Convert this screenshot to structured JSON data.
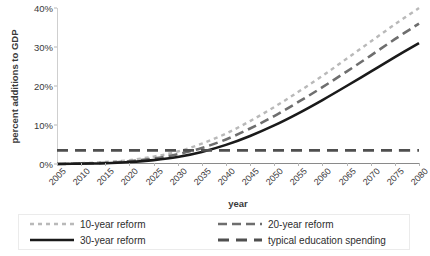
{
  "chart_data": {
    "type": "line",
    "title": "",
    "xlabel": "year",
    "ylabel": "percent additions to GDP",
    "xlim": [
      2005,
      2080
    ],
    "ylim": [
      0,
      40
    ],
    "grid": false,
    "legend_position": "bottom",
    "x_tick_labels": [
      "2005",
      "2010",
      "2015",
      "2020",
      "2025",
      "2030",
      "2035",
      "2040",
      "2045",
      "2050",
      "2055",
      "2060",
      "2065",
      "2070",
      "2075",
      "2080"
    ],
    "y_tick_labels": [
      "0%",
      "10%",
      "20%",
      "30%",
      "40%"
    ],
    "y_tick_values": [
      0,
      10,
      20,
      30,
      40
    ],
    "x": [
      2005,
      2010,
      2015,
      2020,
      2025,
      2030,
      2035,
      2040,
      2045,
      2050,
      2055,
      2060,
      2065,
      2070,
      2075,
      2080
    ],
    "series": [
      {
        "name": "10-year reform",
        "style": "dotted",
        "color": "#b9b9b9",
        "values": [
          0.0,
          0.2,
          0.5,
          1.0,
          1.9,
          3.2,
          5.2,
          7.8,
          11.0,
          14.6,
          18.5,
          22.6,
          27.0,
          31.4,
          35.8,
          40.0
        ]
      },
      {
        "name": "20-year reform",
        "style": "dashed",
        "color": "#6e6e6e",
        "values": [
          0.0,
          0.1,
          0.3,
          0.7,
          1.4,
          2.5,
          4.1,
          6.3,
          9.1,
          12.3,
          15.9,
          19.7,
          23.7,
          27.8,
          32.0,
          36.0
        ]
      },
      {
        "name": "30-year reform",
        "style": "solid",
        "color": "#1a1a1a",
        "values": [
          0.0,
          0.1,
          0.2,
          0.5,
          1.0,
          1.8,
          3.1,
          4.9,
          7.2,
          9.9,
          13.0,
          16.4,
          20.0,
          23.7,
          27.4,
          31.0
        ]
      },
      {
        "name": "typical education spending",
        "style": "dashed-flat",
        "color": "#4f4f4f",
        "values": [
          3.5,
          3.5,
          3.5,
          3.5,
          3.5,
          3.5,
          3.5,
          3.5,
          3.5,
          3.5,
          3.5,
          3.5,
          3.5,
          3.5,
          3.5,
          3.5
        ]
      }
    ]
  },
  "legend": {
    "entries": [
      {
        "label": "10-year reform"
      },
      {
        "label": "20-year reform"
      },
      {
        "label": "30-year reform"
      },
      {
        "label": "typical education spending"
      }
    ]
  }
}
